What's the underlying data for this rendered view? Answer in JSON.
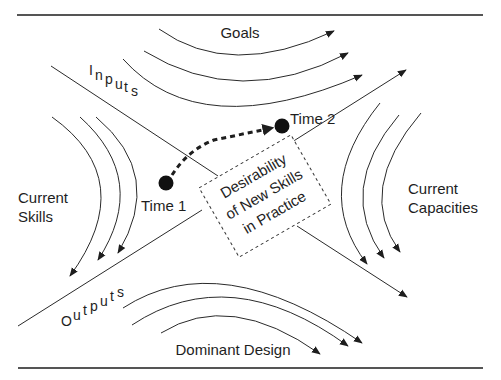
{
  "diagram": {
    "regions": {
      "top": "Goals",
      "bottom": "Dominant Design",
      "left_line1": "Current",
      "left_line2": "Skills",
      "right_line1": "Current",
      "right_line2": "Capacities"
    },
    "axes": {
      "inputs": [
        "I",
        "n",
        "p",
        "u",
        "t",
        "s"
      ],
      "outputs": [
        "O",
        "u",
        "t",
        "p",
        "u",
        "t",
        "s"
      ]
    },
    "center_box": {
      "line1": "Desirability",
      "line2": "of New Skills",
      "line3": "in Practice"
    },
    "points": {
      "time1": "Time 1",
      "time2": "Time 2"
    },
    "colors": {
      "ink": "#1e1e1e",
      "rule": "#555555",
      "background": "#ffffff"
    }
  }
}
